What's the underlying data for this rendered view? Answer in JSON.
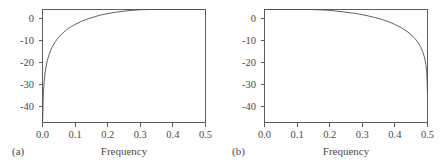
{
  "figure": {
    "background_color": "#ffffff",
    "axis_color": "#5d5d5d",
    "curve_color": "#4f4f4f",
    "text_color": "#4a4a4a"
  },
  "panels": [
    {
      "letter": "(a)",
      "xlabel": "Frequency",
      "ylabel": "",
      "xticks": [
        "0.0",
        "0.1",
        "0.2",
        "0.3",
        "0.4",
        "0.5"
      ],
      "yticks": [
        "0",
        "-10",
        "-20",
        "-30",
        "-40"
      ]
    },
    {
      "letter": "(b)",
      "xlabel": "Frequency",
      "ylabel": "",
      "xticks": [
        "0.0",
        "0.1",
        "0.2",
        "0.3",
        "0.4",
        "0.5"
      ],
      "yticks": [
        "0",
        "-10",
        "-20",
        "-30",
        "-40"
      ]
    }
  ],
  "chart_data": [
    {
      "type": "line",
      "title": "",
      "panel": "(a)",
      "xlabel": "Frequency",
      "ylabel": "",
      "xlim": [
        0.0,
        0.5
      ],
      "ylim": [
        -44,
        6
      ],
      "xticks": [
        0.0,
        0.1,
        0.2,
        0.3,
        0.4,
        0.5
      ],
      "xticklabels": [
        "0.0",
        "0.1",
        "0.2",
        "0.3",
        "0.4",
        "0.5"
      ],
      "yticks": [
        0,
        -10,
        -20,
        -30,
        -40
      ],
      "yticklabels": [
        "0",
        "-10",
        "-20",
        "-30",
        "-40"
      ],
      "grid": false,
      "legend": false,
      "series": [
        {
          "name": "first-difference filter gain (dB)",
          "x": [
            0.0005,
            0.001,
            0.002,
            0.003,
            0.004,
            0.005,
            0.0075,
            0.01,
            0.0125,
            0.015,
            0.02,
            0.025,
            0.03,
            0.04,
            0.05,
            0.06,
            0.07,
            0.08,
            0.09,
            0.1,
            0.12,
            0.14,
            0.16,
            0.18,
            0.2,
            0.22,
            0.25,
            0.28,
            0.3,
            0.33,
            0.36,
            0.4,
            0.44,
            0.47,
            0.5
          ],
          "y": [
            -43.0,
            -40.0,
            -34.0,
            -30.5,
            -28.0,
            -26.0,
            -22.5,
            -20.0,
            -18.1,
            -16.5,
            -14.0,
            -12.1,
            -10.5,
            -8.1,
            -6.2,
            -4.7,
            -3.4,
            -2.3,
            -1.4,
            -0.6,
            0.8,
            1.9,
            2.8,
            3.6,
            4.2,
            4.7,
            5.3,
            5.7,
            5.9,
            6.2,
            6.4,
            6.5,
            6.6,
            6.6,
            6.6
          ]
        }
      ]
    },
    {
      "type": "line",
      "title": "",
      "panel": "(b)",
      "xlabel": "Frequency",
      "ylabel": "",
      "xlim": [
        0.0,
        0.5
      ],
      "ylim": [
        -44,
        6
      ],
      "xticks": [
        0.0,
        0.1,
        0.2,
        0.3,
        0.4,
        0.5
      ],
      "xticklabels": [
        "0.0",
        "0.1",
        "0.2",
        "0.3",
        "0.4",
        "0.5"
      ],
      "yticks": [
        0,
        -10,
        -20,
        -30,
        -40
      ],
      "yticklabels": [
        "0",
        "-10",
        "-20",
        "-30",
        "-40"
      ],
      "grid": false,
      "legend": false,
      "series": [
        {
          "name": "moving-average filter gain (dB)",
          "x": [
            0.0,
            0.03,
            0.06,
            0.1,
            0.14,
            0.18,
            0.2,
            0.22,
            0.25,
            0.28,
            0.3,
            0.32,
            0.34,
            0.36,
            0.38,
            0.4,
            0.42,
            0.44,
            0.45,
            0.46,
            0.47,
            0.475,
            0.48,
            0.485,
            0.49,
            0.4925,
            0.495,
            0.4975,
            0.499,
            0.4995
          ],
          "y": [
            6.6,
            6.6,
            6.5,
            6.4,
            6.1,
            5.8,
            5.6,
            5.3,
            4.8,
            4.2,
            3.7,
            3.1,
            2.4,
            1.6,
            0.6,
            -0.6,
            -2.1,
            -4.0,
            -5.2,
            -6.6,
            -8.4,
            -9.5,
            -10.9,
            -12.6,
            -14.8,
            -16.4,
            -18.4,
            -21.6,
            -26.0,
            -30.0
          ]
        }
      ]
    }
  ]
}
